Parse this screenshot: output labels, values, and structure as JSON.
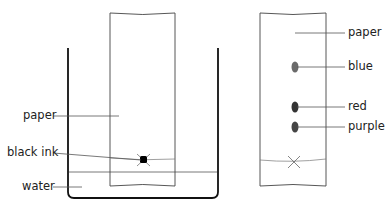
{
  "diagram": {
    "left": {
      "labels": {
        "paper": "paper",
        "black_ink": "black ink",
        "water": "water"
      }
    },
    "right": {
      "labels": {
        "paper": "paper",
        "blue": "blue",
        "red": "red",
        "purple": "purple"
      },
      "spot_colors": {
        "blue": "#6a6a6a",
        "red": "#3a3a3a",
        "purple": "#4a4a4a"
      }
    }
  }
}
